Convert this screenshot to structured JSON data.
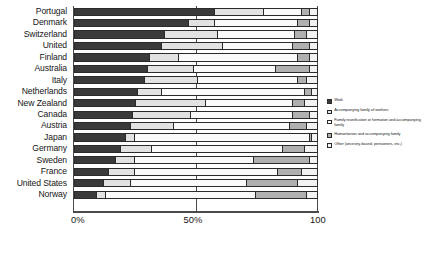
{
  "chart_data": {
    "type": "bar",
    "orientation": "horizontal",
    "stacked": true,
    "normalized_percent": true,
    "title": "",
    "xlabel": "",
    "ylabel": "",
    "xlim": [
      0,
      100
    ],
    "xticks": [
      "0%",
      "50%",
      "100"
    ],
    "xtick_values": [
      0,
      50,
      100
    ],
    "grid": true,
    "legend_position": "right",
    "categories": [
      "Portugal",
      "Denmark",
      "Switzerland",
      "United",
      "Finland",
      "Australia",
      "Italy",
      "Netherlands",
      "New Zealand",
      "Canada",
      "Austria",
      "Japan",
      "Germany",
      "Sweden",
      "France",
      "United States",
      "Norway"
    ],
    "series": [
      {
        "name": "Work",
        "color": "#3a3a3a",
        "values": [
          58,
          47,
          37,
          36,
          31,
          30,
          29,
          26,
          25,
          24,
          23,
          21,
          19,
          17,
          14,
          12,
          9
        ]
      },
      {
        "name": "Accompanying family of workers",
        "color": "#e2e2e2",
        "values": [
          20,
          11,
          22,
          25,
          12,
          19,
          22,
          10,
          29,
          24,
          18,
          4,
          13,
          8,
          11,
          11,
          4
        ]
      },
      {
        "name": "Family reunification or formation and accompanying family",
        "color": "#fafafa",
        "values": [
          16,
          34,
          32,
          29,
          49,
          34,
          41,
          59,
          36,
          42,
          48,
          72,
          54,
          49,
          59,
          48,
          62
        ]
      },
      {
        "name": "Humanitarian and accompanying family",
        "color": "#b0b0b0",
        "values": [
          3,
          5,
          5,
          7,
          5,
          14,
          4,
          3,
          5,
          7,
          7,
          1,
          9,
          23,
          10,
          21,
          21
        ]
      },
      {
        "name": "Other (ancestry-based, pensioners, etc.)",
        "color": "#f2f2f2",
        "values": [
          3,
          3,
          4,
          3,
          3,
          3,
          4,
          2,
          5,
          3,
          4,
          2,
          5,
          3,
          6,
          8,
          4
        ]
      }
    ]
  }
}
